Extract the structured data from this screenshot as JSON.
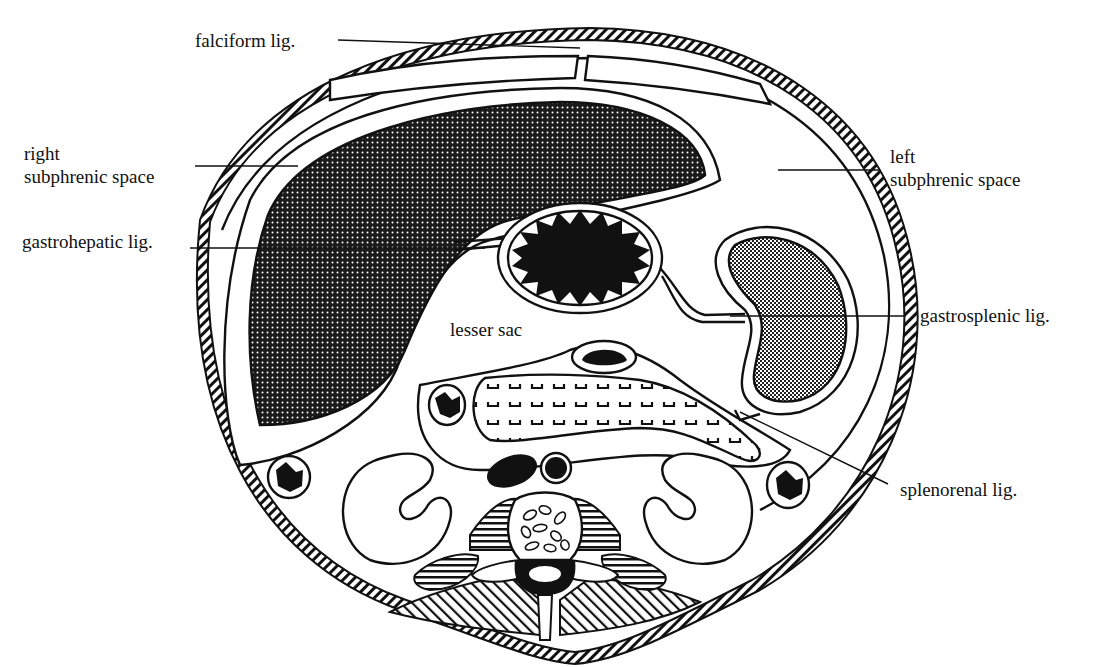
{
  "figure": {
    "type": "anatomical cross-section"
  },
  "labels": {
    "falciform": "falciform lig.",
    "right_subphrenic_1": "right",
    "right_subphrenic_2": "subphrenic space",
    "left_subphrenic_1": "left",
    "left_subphrenic_2": "subphrenic space",
    "gastrohepatic": "gastrohepatic lig.",
    "lesser_sac": "lesser sac",
    "gastrosplenic": "gastrosplenic lig.",
    "splenorenal": "splenorenal lig."
  },
  "colors": {
    "ink": "#111111",
    "background": "#ffffff"
  }
}
